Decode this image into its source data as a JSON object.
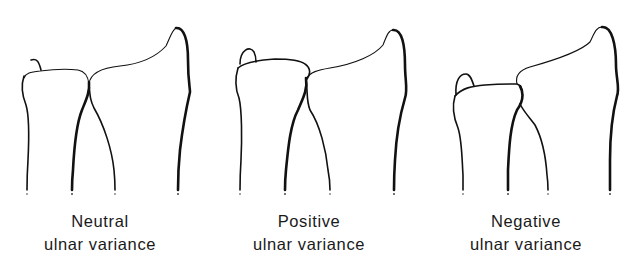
{
  "figure": {
    "panels": [
      {
        "id": "neutral",
        "label_line1": "Neutral",
        "label_line2": "ulnar variance"
      },
      {
        "id": "positive",
        "label_line1": "Positive",
        "label_line2": "ulnar variance"
      },
      {
        "id": "negative",
        "label_line1": "Negative",
        "label_line2": "ulnar variance"
      }
    ],
    "bones": [
      "ulna",
      "radius"
    ],
    "line_color": "#111111",
    "background": "#ffffff"
  }
}
